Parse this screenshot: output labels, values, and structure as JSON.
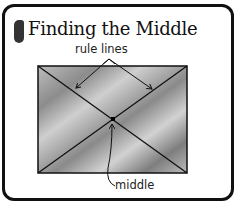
{
  "title": {
    "step_number": "1",
    "text": "Finding the Middle"
  },
  "diagram": {
    "label_rule_lines": "rule lines",
    "label_middle": "middle",
    "colors": {
      "stroke": "#111111",
      "fill_light": "#c8c8c8",
      "fill_dark": "#8a8a8a"
    }
  }
}
